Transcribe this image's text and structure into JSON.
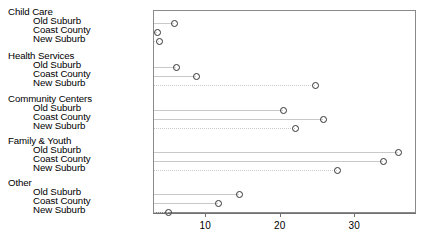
{
  "chart_data": {
    "type": "scatter",
    "subtype": "cleveland-dot-plot",
    "title": "",
    "xlabel": "",
    "ylabel": "",
    "xlim": [
      3.0,
      38.3
    ],
    "xticks": [
      10,
      20,
      30
    ],
    "xtick_labels": [
      "10",
      "20",
      "30"
    ],
    "grid": true,
    "grid_style": "horizontal row guides",
    "legend": "none",
    "marker": "open-circle",
    "groups": [
      {
        "group": "Child Care",
        "categories": [
          "Old Suburb",
          "Coast County",
          "New Suburb"
        ],
        "values": [
          5.7,
          3.4,
          3.7
        ]
      },
      {
        "group": "Health Services",
        "categories": [
          "Old Suburb",
          "Coast County",
          "New Suburb"
        ],
        "values": [
          6.0,
          8.7,
          24.6
        ]
      },
      {
        "group": "Community Centers",
        "categories": [
          "Old Suburb",
          "Coast County",
          "New Suburb"
        ],
        "values": [
          20.3,
          25.7,
          21.9
        ]
      },
      {
        "group": "Family & Youth",
        "categories": [
          "Old Suburb",
          "Coast County",
          "New Suburb"
        ],
        "values": [
          35.8,
          33.8,
          27.6
        ]
      },
      {
        "group": "Other",
        "categories": [
          "Old Suburb",
          "Coast County",
          "New Suburb"
        ],
        "values": [
          14.4,
          11.6,
          4.9
        ]
      }
    ]
  },
  "caption": ""
}
